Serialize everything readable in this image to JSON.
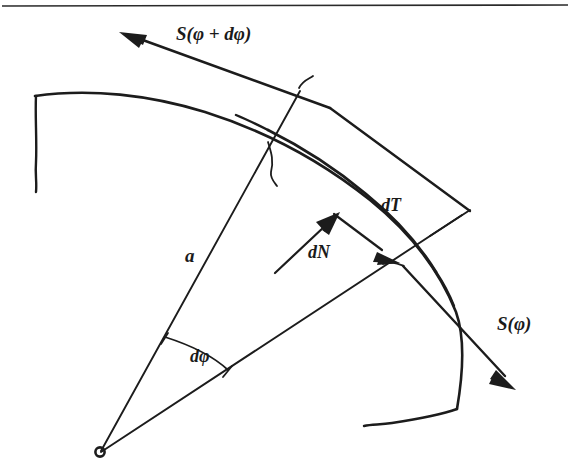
{
  "figure": {
    "domain": "Diagram",
    "title_rule_present": true,
    "background_color": "#ffffff",
    "ink_color": "#1c1c1c",
    "labels": {
      "tension_out": "S(φ + dφ)",
      "tension_in": "S(φ)",
      "normal_force": "dN",
      "tangential_force": "dT",
      "radius": "a",
      "angle": "dφ"
    },
    "elements": {
      "pivot_label": "center-of-curvature",
      "inner_arc_label": "inner-arc",
      "outer_arc_label": "outer-arc",
      "radius_line_upper_label": "radius-line-upper",
      "radius_line_lower_label": "radius-line-lower",
      "angle_arc_label": "angle-arc",
      "band_upper_edge_label": "band-edge-upper",
      "band_lower_edge_label": "band-edge-lower"
    },
    "geometry": {
      "center_x": 100,
      "center_y": 452,
      "radius_inner": 392,
      "radius_outer": 430,
      "angle_start_deg": 45,
      "angle_end_deg": 74,
      "d_phi_marker_radius": 120
    }
  }
}
